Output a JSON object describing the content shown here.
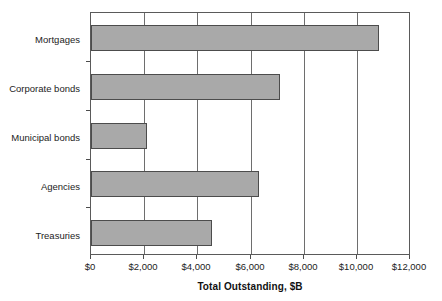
{
  "chart_data": {
    "type": "bar",
    "orientation": "horizontal",
    "title": "",
    "xlabel": "Total Outstanding, $B",
    "ylabel": "",
    "categories": [
      "Mortgages",
      "Corporate bonds",
      "Municipal bonds",
      "Agencies",
      "Treasuries"
    ],
    "values": [
      10850,
      7150,
      2120,
      6330,
      4570
    ],
    "xlim": [
      0,
      12000
    ],
    "ylim": [
      0,
      5
    ],
    "xticks": [
      0,
      2000,
      4000,
      6000,
      8000,
      10000,
      12000
    ],
    "xticklabels": [
      "$0",
      "$2,000",
      "$4,000",
      "$6,000",
      "$8,000",
      "$10,000",
      "$12,000"
    ],
    "grid": "vertical",
    "legend": "none",
    "series": [
      {
        "name": "Total Outstanding",
        "values": [
          10850,
          7150,
          2120,
          6330,
          4570
        ]
      }
    ],
    "bar_color": "#a9a9a9",
    "bar_edge_color": "#4c4c4c",
    "gridline_color": "#6e6e6e",
    "axis_color": "#5a5a5a"
  },
  "axis": {
    "x_title": "Total Outstanding, $B"
  },
  "y_labels": [
    {
      "label": "Mortgages"
    },
    {
      "label": "Corporate bonds"
    },
    {
      "label": "Municipal bonds"
    },
    {
      "label": "Agencies"
    },
    {
      "label": "Treasuries"
    }
  ],
  "x_labels": [
    {
      "label": "$0"
    },
    {
      "label": "$2,000"
    },
    {
      "label": "$4,000"
    },
    {
      "label": "$6,000"
    },
    {
      "label": "$8,000"
    },
    {
      "label": "$10,000"
    },
    {
      "label": "$12,000"
    }
  ]
}
